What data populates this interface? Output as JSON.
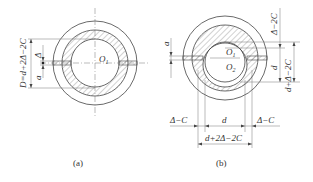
{
  "figure": {
    "panels": [
      {
        "id": "a",
        "caption": "(a)",
        "center_label": "O1",
        "dimension_labels": {
          "outer_height": "D=d+2Δ−2C",
          "delta": "Δ",
          "gap": "a"
        }
      },
      {
        "id": "b",
        "caption": "(b)",
        "center_labels": [
          "O1",
          "O2"
        ],
        "dimension_labels": {
          "top_right": "Δ−2C",
          "inner_d_vertical": "d",
          "right_total": "d+Δ−2C",
          "gap": "a",
          "left_bottom": "Δ−C",
          "bottom_d": "d",
          "right_bottom": "Δ−C",
          "bottom_total": "d+2Δ−2C"
        }
      }
    ]
  }
}
